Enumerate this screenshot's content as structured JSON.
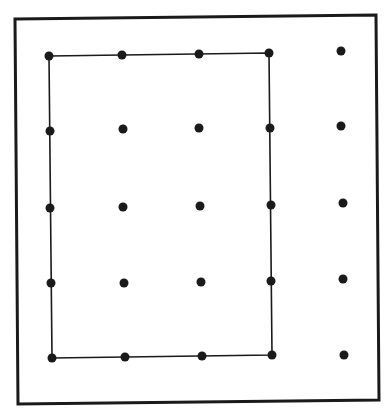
{
  "diagram": {
    "type": "geoboard",
    "colors": {
      "background": "#ffffff",
      "ink": "#1a1a1a"
    },
    "frame": {
      "points": [
        [
          15,
          19
        ],
        [
          376,
          15
        ],
        [
          379,
          400
        ],
        [
          18,
          404
        ]
      ]
    },
    "grid": {
      "rows": 5,
      "cols": 5
    },
    "pegs": [
      [
        [
          49,
          56
        ],
        [
          122,
          55
        ],
        [
          199,
          54
        ],
        [
          269,
          53
        ],
        [
          341,
          51
        ]
      ],
      [
        [
          50,
          131
        ],
        [
          123,
          129
        ],
        [
          199,
          128
        ],
        [
          270,
          128
        ],
        [
          341,
          126
        ]
      ],
      [
        [
          50,
          208
        ],
        [
          123,
          207
        ],
        [
          200,
          206
        ],
        [
          271,
          205
        ],
        [
          343,
          203
        ]
      ],
      [
        [
          51,
          283
        ],
        [
          124,
          283
        ],
        [
          201,
          282
        ],
        [
          271,
          281
        ],
        [
          343,
          279
        ]
      ],
      [
        [
          52,
          358
        ],
        [
          125,
          357
        ],
        [
          202,
          356
        ],
        [
          272,
          355
        ],
        [
          344,
          355
        ]
      ]
    ],
    "rectangle": {
      "label": "rectangle band",
      "corners_grid": [
        [
          0,
          0
        ],
        [
          0,
          3
        ],
        [
          4,
          3
        ],
        [
          4,
          0
        ]
      ],
      "width_units": 3,
      "height_units": 4
    }
  }
}
